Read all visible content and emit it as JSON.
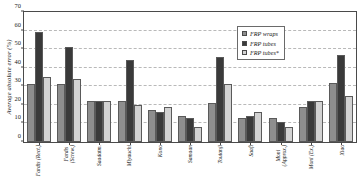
{
  "chart_data": {
    "type": "bar",
    "title": "",
    "xlabel": "",
    "ylabel": "Average absolute error (%)",
    "ylim": [
      0,
      70
    ],
    "yticks": [
      0,
      10,
      20,
      30,
      40,
      50,
      60,
      70
    ],
    "grid": true,
    "legend_position": "top-right",
    "categories": [
      "Fardis (Rect.)",
      "Fardis (Screw.)",
      "Saadatm.",
      "Miyauchi",
      "Kono",
      "Samaan",
      "Toutanji",
      "Saafi",
      "Moni (Approx.)",
      "Moni (Ex.)",
      "Xiao"
    ],
    "category_lines": [
      [
        "Fardis (Rect.)"
      ],
      [
        "Fardis",
        "(Screw.)"
      ],
      [
        "Saadatm."
      ],
      [
        "Miyauchi"
      ],
      [
        "Kono"
      ],
      [
        "Samaan"
      ],
      [
        "Toutanji"
      ],
      [
        "Saafi"
      ],
      [
        "Moni",
        "(Approx.)"
      ],
      [
        "Moni (Ex.)"
      ],
      [
        "Xiao"
      ]
    ],
    "series": [
      {
        "name": "FRP wraps",
        "color": "#8e8e8e",
        "values": [
          31,
          31,
          22,
          22,
          17,
          14,
          21,
          13,
          13,
          19,
          32
        ]
      },
      {
        "name": "FRP tubes",
        "color": "#3a3a3a",
        "values": [
          59,
          51,
          22,
          44,
          16,
          13,
          46,
          14,
          11,
          22,
          47
        ]
      },
      {
        "name": "FRP tubes*",
        "color": "#d2d2d2",
        "values": [
          35,
          34,
          22,
          20,
          19,
          8,
          31,
          16,
          8,
          22,
          25
        ]
      }
    ]
  },
  "legend": {
    "items": [
      {
        "label": "FRP wraps",
        "color": "#8e8e8e"
      },
      {
        "label": "FRP tubes",
        "color": "#3a3a3a"
      },
      {
        "label": "FRP tubes*",
        "color": "#d2d2d2"
      }
    ]
  }
}
